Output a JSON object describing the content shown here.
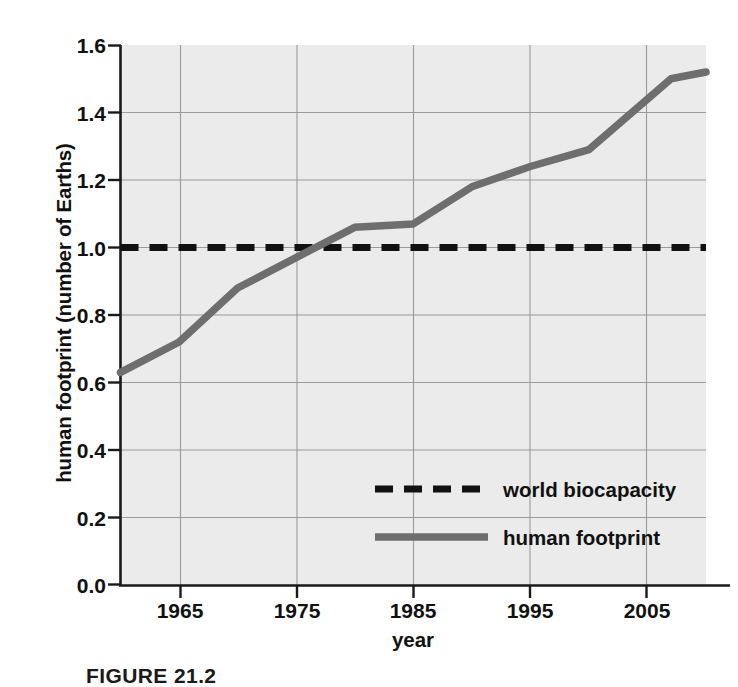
{
  "chart_data": {
    "type": "line",
    "title": "",
    "xlabel": "year",
    "ylabel": "human footprint (number of Earths)",
    "xlim": [
      1960,
      2010
    ],
    "ylim": [
      0.0,
      1.6
    ],
    "grid": true,
    "legend_position": "center-lower",
    "xticks": [
      "1965",
      "1975",
      "1985",
      "1995",
      "2005"
    ],
    "xtick_values": [
      1965,
      1975,
      1985,
      1995,
      2005
    ],
    "yticks": [
      "0.0",
      "0.2",
      "0.4",
      "0.6",
      "0.8",
      "1.0",
      "1.2",
      "1.4",
      "1.6"
    ],
    "ytick_values": [
      0.0,
      0.2,
      0.4,
      0.6,
      0.8,
      1.0,
      1.2,
      1.4,
      1.6
    ],
    "series": [
      {
        "name": "world biocapacity",
        "style": "dashed",
        "color": "#111111",
        "x": [
          1960,
          2010
        ],
        "values": [
          1.0,
          1.0
        ]
      },
      {
        "name": "human footprint",
        "style": "solid",
        "color": "#6e6e6e",
        "x": [
          1960,
          1965,
          1970,
          1975,
          1980,
          1985,
          1990,
          1995,
          2000,
          2007,
          2010
        ],
        "values": [
          0.63,
          0.72,
          0.88,
          0.97,
          1.06,
          1.07,
          1.18,
          1.24,
          1.29,
          1.5,
          1.52
        ]
      }
    ]
  },
  "legend": {
    "items": [
      {
        "label": "world biocapacity",
        "style": "dashed",
        "color": "#111111"
      },
      {
        "label": "human footprint",
        "style": "solid",
        "color": "#6e6e6e"
      }
    ]
  },
  "caption": "FIGURE 21.2",
  "colors": {
    "plot_background": "#ebebeb",
    "grid": "#9a9a9a",
    "axis": "#1a1a1a",
    "biocapacity": "#111111",
    "footprint": "#6e6e6e"
  }
}
